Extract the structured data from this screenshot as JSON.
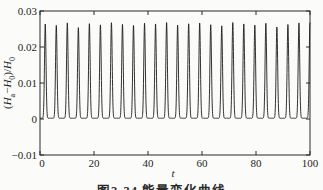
{
  "figure_caption": "图2-34 能量变化曲线",
  "chart_data": {
    "type": "line",
    "title": "",
    "xlabel": "t",
    "ylabel": "(H_a−H_0)/H_0",
    "xlim": [
      0,
      100
    ],
    "ylim": [
      -0.01,
      0.03
    ],
    "xticks": [
      "0",
      "20",
      "40",
      "60",
      "80",
      "100"
    ],
    "yticks": [
      "0.03",
      "0.02",
      "0.01",
      "0",
      "−0.01"
    ],
    "grid": false,
    "legend": "none",
    "box": true,
    "line_color": "#1c1c1c",
    "axis_color": "#2b2b2b",
    "background_color": "#fbfbf9",
    "series": [
      {
        "name": "relative-head-deviation",
        "shape": "periodic-spikes",
        "baseline": 0.0002,
        "spike_sigma": 0.4,
        "spike_times": [
          1.95,
          6.04,
          10.12,
          14.21,
          18.29,
          22.38,
          26.46,
          30.55,
          34.63,
          38.72,
          42.8,
          46.89,
          50.97,
          55.06,
          59.14,
          63.23,
          67.31,
          71.4,
          75.48,
          79.57,
          83.65,
          87.74,
          91.82,
          95.91,
          99.99
        ],
        "spike_peaks": [
          0.0262,
          0.0258,
          0.0265,
          0.0252,
          0.0263,
          0.026,
          0.0266,
          0.0261,
          0.0258,
          0.0264,
          0.0262,
          0.0266,
          0.0259,
          0.0263,
          0.0265,
          0.026,
          0.0257,
          0.0266,
          0.0262,
          0.0259,
          0.0264,
          0.0254,
          0.0261,
          0.0265,
          0.0266
        ]
      }
    ]
  }
}
